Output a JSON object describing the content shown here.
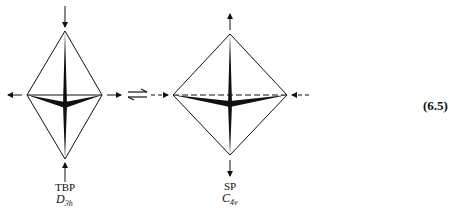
{
  "figure": {
    "left": {
      "name": "TBP",
      "symmetry_main": "D",
      "symmetry_sub": "3h"
    },
    "right": {
      "name": "SP",
      "symmetry_main": "C",
      "symmetry_sub": "4v"
    },
    "equilibrium_symbol": "equilibrium-arrows",
    "equation_number": "(6.5)"
  }
}
